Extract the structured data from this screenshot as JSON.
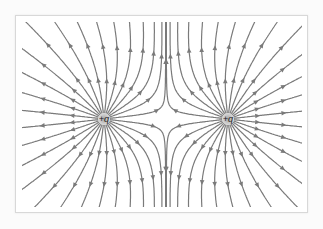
{
  "diagram": {
    "title": "",
    "type": "electric-field-lines",
    "line_color": "#7a7a7a",
    "charge_glow_color": "#9a9a9a",
    "frame": {
      "x": 15,
      "y": 15,
      "width": 293,
      "height": 198
    },
    "charges": [
      {
        "label": "+q",
        "sign": 1,
        "x": 104,
        "y": 119
      },
      {
        "label": "+q",
        "sign": 1,
        "x": 228,
        "y": 119
      }
    ],
    "lines_per_charge": 28,
    "arrow_direction": "outward"
  }
}
